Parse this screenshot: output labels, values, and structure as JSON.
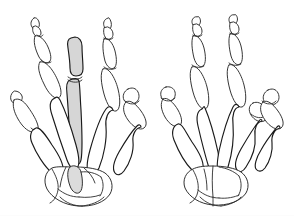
{
  "figure": {
    "title": "Skeletal anatomy of both hands, dorsal view",
    "caption": "",
    "width": 294,
    "height": 216,
    "background_color": "#ffffff",
    "line_color": "#1a1a1a",
    "highlight_color": "#d6d6d6",
    "style": "line drawing"
  },
  "highlight": {
    "label": "third digit ray highlighted",
    "color": "#d6d6d6",
    "hand": "left hand",
    "bones": [
      "proximal phalanx of middle finger",
      "third metacarpal",
      "capitate region"
    ]
  },
  "hands": [
    {
      "id": "left-hand",
      "label": "Left hand",
      "side": "left",
      "highlighted": true,
      "digits": [
        {
          "id": "thumb",
          "label": "Thumb",
          "number": 1,
          "phalanx_count": 2
        },
        {
          "id": "index",
          "label": "Index finger",
          "number": 2,
          "phalanx_count": 3
        },
        {
          "id": "middle",
          "label": "Middle finger",
          "number": 3,
          "phalanx_count": 3
        },
        {
          "id": "ring",
          "label": "Ring finger",
          "number": 4,
          "phalanx_count": 3
        },
        {
          "id": "little",
          "label": "Little finger",
          "number": 5,
          "phalanx_count": 3
        }
      ],
      "regions": [
        {
          "id": "phalanges",
          "label": "Phalanges"
        },
        {
          "id": "metacarpals",
          "label": "Metacarpals"
        },
        {
          "id": "carpals",
          "label": "Carpals"
        }
      ]
    },
    {
      "id": "right-hand",
      "label": "Right hand",
      "side": "right",
      "highlighted": false,
      "digits": [
        {
          "id": "thumb",
          "label": "Thumb",
          "number": 1,
          "phalanx_count": 2
        },
        {
          "id": "index",
          "label": "Index finger",
          "number": 2,
          "phalanx_count": 3
        },
        {
          "id": "middle",
          "label": "Middle finger",
          "number": 3,
          "phalanx_count": 3
        },
        {
          "id": "ring",
          "label": "Ring finger",
          "number": 4,
          "phalanx_count": 3
        },
        {
          "id": "little",
          "label": "Little finger",
          "number": 5,
          "phalanx_count": 3
        }
      ],
      "regions": [
        {
          "id": "phalanges",
          "label": "Phalanges"
        },
        {
          "id": "metacarpals",
          "label": "Metacarpals"
        },
        {
          "id": "carpals",
          "label": "Carpals"
        }
      ]
    }
  ]
}
